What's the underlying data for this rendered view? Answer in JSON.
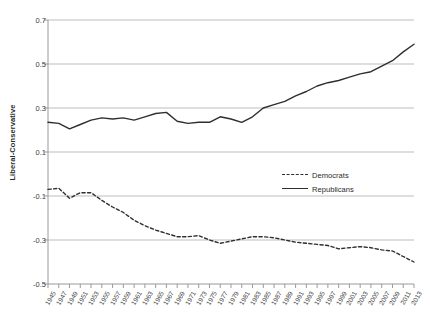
{
  "chart_data": {
    "type": "line",
    "title": "",
    "xlabel": "",
    "ylabel": "Liberal-Conservative",
    "ylim": [
      -0.5,
      0.7
    ],
    "yticks": [
      0.7,
      0.5,
      0.3,
      0.1,
      -0.1,
      -0.3,
      -0.5
    ],
    "ytick_labels": [
      "0.7",
      "0.5",
      "0.3",
      "0.1",
      "-0.1",
      "-0.3",
      "-0.5"
    ],
    "grid": true,
    "legend_position": "center-right",
    "x": [
      1945,
      1947,
      1949,
      1951,
      1953,
      1955,
      1957,
      1959,
      1961,
      1963,
      1965,
      1967,
      1969,
      1971,
      1973,
      1975,
      1977,
      1979,
      1981,
      1983,
      1985,
      1987,
      1989,
      1991,
      1993,
      1995,
      1997,
      1999,
      2001,
      2003,
      2005,
      2007,
      2009,
      2011,
      2013
    ],
    "xtick_labels": [
      "1945",
      "1947",
      "1949",
      "1951",
      "1953",
      "1955",
      "1957",
      "1959",
      "1961",
      "1963",
      "1965",
      "1967",
      "1969",
      "1971",
      "1973",
      "1975",
      "1977",
      "1979",
      "1981",
      "1983",
      "1985",
      "1987",
      "1989",
      "1991",
      "1993",
      "1995",
      "1997",
      "1999",
      "2001",
      "2003",
      "2005",
      "2007",
      "2009",
      "2011",
      "2013"
    ],
    "series": [
      {
        "name": "Democrats",
        "style": "dashed",
        "color": "#2f2f2f",
        "values": [
          -0.07,
          -0.065,
          -0.11,
          -0.085,
          -0.085,
          -0.12,
          -0.15,
          -0.175,
          -0.21,
          -0.235,
          -0.255,
          -0.27,
          -0.285,
          -0.285,
          -0.28,
          -0.3,
          -0.315,
          -0.305,
          -0.295,
          -0.285,
          -0.285,
          -0.29,
          -0.3,
          -0.31,
          -0.315,
          -0.32,
          -0.325,
          -0.34,
          -0.335,
          -0.33,
          -0.335,
          -0.345,
          -0.35,
          -0.375,
          -0.4
        ]
      },
      {
        "name": "Republicans",
        "style": "solid",
        "color": "#2f2f2f",
        "values": [
          0.235,
          0.23,
          0.205,
          0.225,
          0.245,
          0.255,
          0.25,
          0.255,
          0.245,
          0.26,
          0.275,
          0.28,
          0.24,
          0.23,
          0.235,
          0.235,
          0.26,
          0.25,
          0.235,
          0.26,
          0.3,
          0.315,
          0.33,
          0.355,
          0.375,
          0.4,
          0.415,
          0.425,
          0.44,
          0.455,
          0.465,
          0.49,
          0.515,
          0.555,
          0.59
        ]
      }
    ]
  },
  "legend": {
    "items": [
      {
        "label": "Democrats",
        "style": "dashed"
      },
      {
        "label": "Republicans",
        "style": "solid"
      }
    ]
  },
  "axes": {
    "y_title": "Liberal-Conservative"
  }
}
